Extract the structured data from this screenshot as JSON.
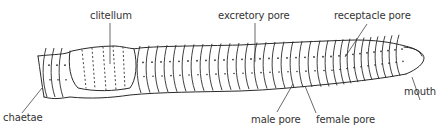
{
  "diagram": {
    "labels": {
      "clitellum": "clitellum",
      "excretory_pore": "excretory pore",
      "receptacle_pore": "receptacle pore",
      "chaetae": "chaetae",
      "male_pore": "male pore",
      "female_pore": "female pore",
      "mouth": "mouth"
    },
    "colors": {
      "ink": "#2a2a2a",
      "label": "#333333",
      "background": "#ffffff"
    }
  }
}
